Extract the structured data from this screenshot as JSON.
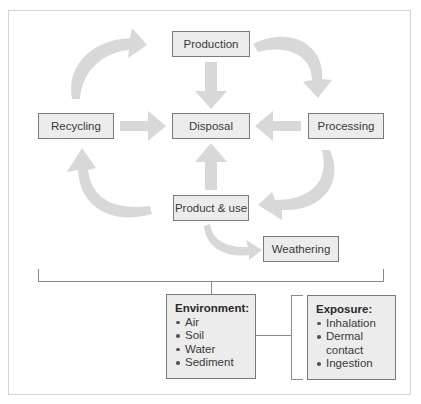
{
  "nodes": {
    "production": "Production",
    "recycling": "Recycling",
    "disposal": "Disposal",
    "processing": "Processing",
    "product_use": "Product & use",
    "weathering": "Weathering"
  },
  "environment": {
    "title": "Environment:",
    "items": [
      "Air",
      "Soil",
      "Water",
      "Sediment"
    ]
  },
  "exposure": {
    "title": "Exposure:",
    "items": [
      "Inhalation",
      "Dermal contact",
      "Ingestion"
    ]
  },
  "colors": {
    "box_fill": "#ececec",
    "box_border": "#7a7a7a",
    "arrow": "#d6d6d6",
    "line": "#8a8a8a"
  }
}
